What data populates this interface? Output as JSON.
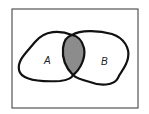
{
  "diagram": {
    "type": "venn",
    "sets": [
      {
        "label": "A"
      },
      {
        "label": "B"
      }
    ],
    "shaded_region": "A ∩ B",
    "colors": {
      "outline": "#111111",
      "shade": "#8c8c8c",
      "frame": "#333333",
      "background": "#ffffff"
    }
  }
}
